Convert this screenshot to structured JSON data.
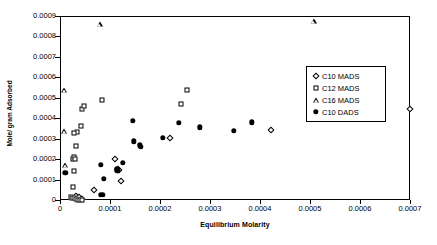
{
  "chart_data": {
    "type": "scatter",
    "title": "",
    "xlabel": "Equilibrium Molarity",
    "ylabel": "Mole/ gram Adsorbed",
    "xlim": [
      0,
      0.0007
    ],
    "ylim": [
      0,
      0.0009
    ],
    "xticks": [
      "0",
      "0.0001",
      "0.0002",
      "0.0003",
      "0.0004",
      "0.0005",
      "0.0006",
      "0.0007"
    ],
    "xtick_values": [
      0,
      0.0001,
      0.0002,
      0.0003,
      0.0004,
      0.0005,
      0.0006,
      0.0007
    ],
    "yticks": [
      "0",
      "0.0001",
      "0.0002",
      "0.0003",
      "0.0004",
      "0.0005",
      "0.0006",
      "0.0007",
      "0.0008",
      "0.0009"
    ],
    "ytick_values": [
      0,
      0.0001,
      0.0002,
      0.0003,
      0.0004,
      0.0005,
      0.0006,
      0.0007,
      0.0008,
      0.0009
    ],
    "grid": false,
    "legend_position": "upper right",
    "series": [
      {
        "name": "C10 MADS",
        "marker": "diamond-open",
        "points": [
          [
            3e-05,
            2.5e-05
          ],
          [
            3.5e-05,
            1.8e-05
          ],
          [
            3.9e-05,
            1.2e-05
          ],
          [
            4.2e-05,
            8e-06
          ],
          [
            6.6e-05,
            5.2e-05
          ],
          [
            0.000108,
            0.000204
          ],
          [
            0.000113,
            0.000158
          ],
          [
            0.000115,
            0.000151
          ],
          [
            0.00012,
            0.0001
          ],
          [
            0.000217,
            0.000309
          ],
          [
            0.00042,
            0.000349
          ],
          [
            0.000698,
            0.00045
          ]
        ]
      },
      {
        "name": "C12 MADS",
        "marker": "square-open",
        "points": [
          [
            1.9e-05,
            2e-05
          ],
          [
            2.1e-05,
            1.7e-05
          ],
          [
            2.5e-05,
            1.5e-05
          ],
          [
            3e-05,
            1.2e-05
          ],
          [
            3.3e-05,
            7e-06
          ],
          [
            3.7e-05,
            5e-06
          ],
          [
            4.2e-05,
            3e-06
          ],
          [
            2.3e-05,
            7e-05
          ],
          [
            2.5e-05,
            0.000147
          ],
          [
            2.3e-05,
            0.000207
          ],
          [
            2.65e-05,
            0.000214
          ],
          [
            2.85e-05,
            0.000204
          ],
          [
            3e-05,
            0.000267
          ],
          [
            3.2e-05,
            0.000337
          ],
          [
            2.55e-05,
            0.000334
          ],
          [
            4e-05,
            0.000366
          ],
          [
            4.1e-05,
            0.000451
          ],
          [
            4.55e-05,
            0.000465
          ],
          [
            8.1e-05,
            0.000495
          ],
          [
            0.00024,
            0.000476
          ],
          [
            0.000251,
            0.000544
          ]
        ]
      },
      {
        "name": "C16 MADS",
        "marker": "triangle-open",
        "points": [
          [
            6e-06,
            0.000542
          ],
          [
            6e-06,
            0.00034
          ],
          [
            8e-06,
            0.000174
          ],
          [
            7.7e-05,
            0.000866
          ],
          [
            0.000505,
            0.00088
          ]
        ]
      },
      {
        "name": "C10 DADS",
        "marker": "circle-filled",
        "points": [
          [
            8.5e-06,
            0.000139
          ],
          [
            7.9e-05,
            3e-05
          ],
          [
            8.4e-05,
            2.9e-05
          ],
          [
            8e-05,
            0.000176
          ],
          [
            8.6e-05,
            0.000109
          ],
          [
            0.000111,
            0.000156
          ],
          [
            0.000114,
            0.000148
          ],
          [
            0.0001125,
            0.000151
          ],
          [
            0.000123,
            0.000187
          ],
          [
            0.000143,
            0.000393
          ],
          [
            0.000145,
            0.000292
          ],
          [
            0.000157,
            0.000273
          ],
          [
            0.00016,
            0.000266
          ],
          [
            0.000203,
            0.00031
          ],
          [
            0.000235,
            0.000381
          ],
          [
            0.000278,
            0.00036
          ],
          [
            0.000346,
            0.000343
          ],
          [
            0.000382,
            0.000385
          ]
        ]
      }
    ]
  },
  "legend": {
    "items": [
      {
        "label": "C10 MADS",
        "marker": "diamond-open"
      },
      {
        "label": "C12 MADS",
        "marker": "square-open"
      },
      {
        "label": "C16 MADS",
        "marker": "triangle-open"
      },
      {
        "label": "C10 DADS",
        "marker": "circle-filled"
      }
    ]
  },
  "colors": {
    "axis": "#000000",
    "marker": "#000000",
    "background": "#ffffff"
  }
}
